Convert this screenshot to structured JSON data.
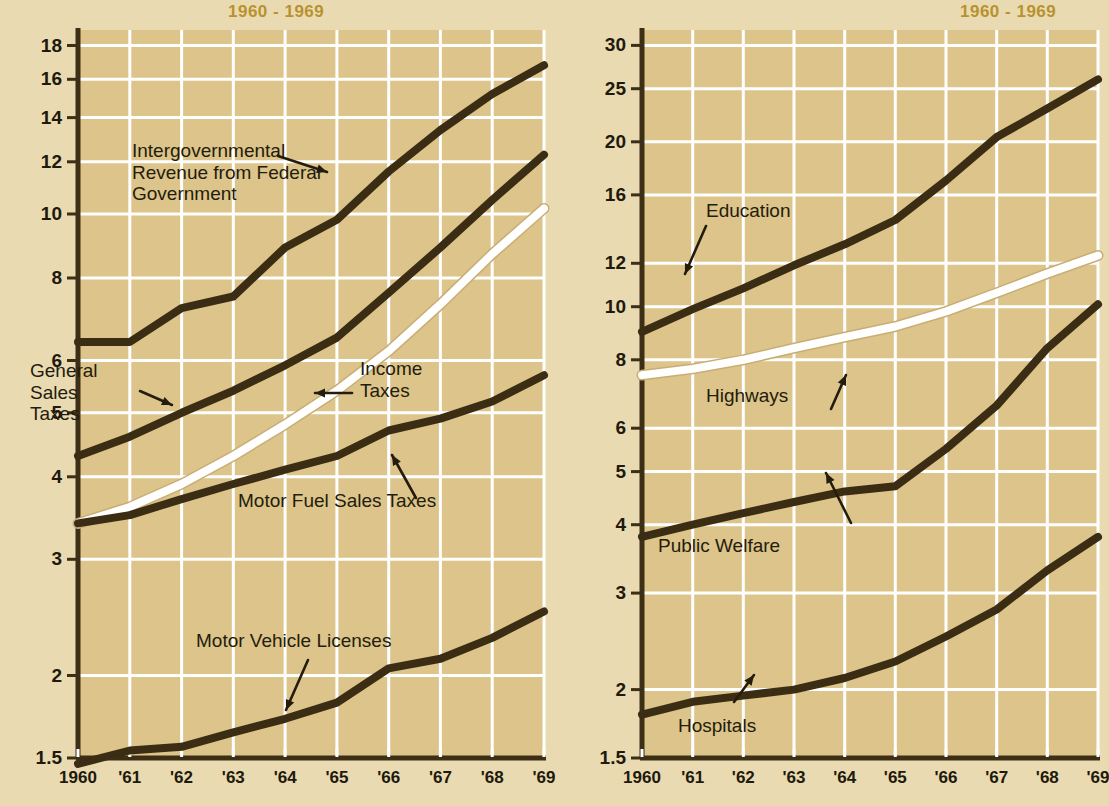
{
  "titles": {
    "left": "1960 - 1969",
    "right": "1960 - 1969"
  },
  "axis_title_left": "RATIO SCALE (BILLIONS OF DOLLARS)",
  "annotations": {
    "intergovernmental": "Intergovernmental\nRevenue from Federal\nGovernment",
    "general_sales": "General\nSales\nTaxes",
    "income_taxes": "Income\nTaxes",
    "motor_fuel": "Motor Fuel Sales Taxes",
    "motor_vehicle": "Motor Vehicle Licenses",
    "education": "Education",
    "highways": "Highways",
    "public_welfare": "Public Welfare",
    "hospitals": "Hospitals"
  },
  "colors": {
    "title": "#b8922e",
    "paper": "#e9dab2",
    "plot_bg": "#dcc48a",
    "grid": "#ffffff",
    "line_dark": "#3b2d14",
    "line_white": "#ffffff",
    "text": "#20190c"
  },
  "chart_data": [
    {
      "type": "line",
      "title": "1960 - 1969",
      "id": "state-revenue",
      "xlabel": "",
      "ylabel": "RATIO SCALE (BILLIONS OF DOLLARS)",
      "scale": "log",
      "grid": true,
      "legend": "inline-annotations",
      "ylim": [
        1.5,
        19
      ],
      "yticks": [
        1.5,
        2,
        3,
        4,
        5,
        6,
        8,
        10,
        12,
        14,
        16,
        18
      ],
      "x": [
        "1960",
        "'61",
        "'62",
        "'63",
        "'64",
        "'65",
        "'66",
        "'67",
        "'68",
        "'69"
      ],
      "xticklabels": [
        "1960",
        "'61",
        "'62",
        "'63",
        "'64",
        "'65",
        "'66",
        "'67",
        "'68",
        "'69"
      ],
      "series": [
        {
          "name": "Intergovernmental Revenue from Federal Government",
          "color": "#3b2d14",
          "values": [
            6.4,
            6.4,
            7.2,
            7.5,
            8.9,
            9.8,
            11.6,
            13.4,
            15.2,
            16.8
          ]
        },
        {
          "name": "General Sales Taxes",
          "color": "#3b2d14",
          "values": [
            4.3,
            4.6,
            5.0,
            5.4,
            5.9,
            6.5,
            7.6,
            8.9,
            10.5,
            12.3
          ]
        },
        {
          "name": "Income Taxes",
          "color": "#ffffff",
          "values": [
            3.4,
            3.6,
            3.9,
            4.3,
            4.8,
            5.4,
            6.2,
            7.3,
            8.7,
            10.2
          ]
        },
        {
          "name": "Motor Fuel Sales Taxes",
          "color": "#3b2d14",
          "values": [
            3.4,
            3.5,
            3.7,
            3.9,
            4.1,
            4.3,
            4.7,
            4.9,
            5.2,
            5.7
          ]
        },
        {
          "name": "Motor Vehicle Licenses",
          "color": "#3b2d14",
          "values": [
            1.47,
            1.54,
            1.56,
            1.64,
            1.72,
            1.82,
            2.05,
            2.12,
            2.28,
            2.5
          ]
        }
      ]
    },
    {
      "type": "line",
      "title": "1960 - 1969",
      "id": "state-expenditure",
      "xlabel": "",
      "ylabel": "",
      "scale": "log",
      "grid": true,
      "legend": "inline-annotations",
      "ylim": [
        1.5,
        32
      ],
      "yticks": [
        1.5,
        2,
        3,
        4,
        5,
        6,
        8,
        10,
        12,
        16,
        20,
        25,
        30
      ],
      "x": [
        "1960",
        "'61",
        "'62",
        "'63",
        "'64",
        "'65",
        "'66",
        "'67",
        "'68",
        "'69"
      ],
      "xticklabels": [
        "1960",
        "'61",
        "'62",
        "'63",
        "'64",
        "'65",
        "'66",
        "'67",
        "'68",
        "'69"
      ],
      "series": [
        {
          "name": "Education",
          "color": "#3b2d14",
          "values": [
            9.0,
            9.9,
            10.8,
            11.9,
            13.0,
            14.4,
            17.0,
            20.4,
            23.0,
            26.0
          ]
        },
        {
          "name": "Highways",
          "color": "#ffffff",
          "values": [
            7.5,
            7.7,
            8.0,
            8.4,
            8.8,
            9.2,
            9.8,
            10.6,
            11.5,
            12.4
          ]
        },
        {
          "name": "Public Welfare",
          "color": "#3b2d14",
          "values": [
            3.8,
            4.0,
            4.2,
            4.4,
            4.6,
            4.7,
            5.5,
            6.6,
            8.4,
            10.1
          ]
        },
        {
          "name": "Hospitals",
          "color": "#3b2d14",
          "values": [
            1.8,
            1.9,
            1.95,
            2.0,
            2.1,
            2.25,
            2.5,
            2.8,
            3.3,
            3.8
          ]
        }
      ]
    }
  ]
}
